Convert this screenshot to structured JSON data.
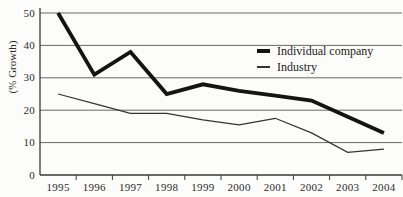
{
  "figure": {
    "background": "#fcfcfa",
    "grid_color": "#585858",
    "axis_color": "#3a3a3a",
    "text_color": "#2b2b2b"
  },
  "chart_data": {
    "type": "line",
    "title": "",
    "xlabel": "",
    "ylabel": "(% Growth)",
    "categories": [
      "1995",
      "1996",
      "1997",
      "1998",
      "1999",
      "2000",
      "2001",
      "2002",
      "2003",
      "2004"
    ],
    "y_ticks": [
      0,
      10,
      20,
      30,
      40,
      50
    ],
    "ylim": [
      0,
      50
    ],
    "grid": "horizontal gridlines every 10 units",
    "legend_position": "inside top-right",
    "series": [
      {
        "name": "Individual company",
        "line_style": "thick solid",
        "color": "#141414",
        "stroke_width": 3.8,
        "values": [
          50,
          31,
          38,
          25,
          28,
          26,
          24.5,
          23,
          18,
          13
        ]
      },
      {
        "name": "Industry",
        "line_style": "thin solid",
        "color": "#333333",
        "stroke_width": 1.2,
        "values": [
          25,
          22,
          19,
          19,
          17,
          15.5,
          17.5,
          13,
          7,
          8
        ]
      }
    ]
  }
}
